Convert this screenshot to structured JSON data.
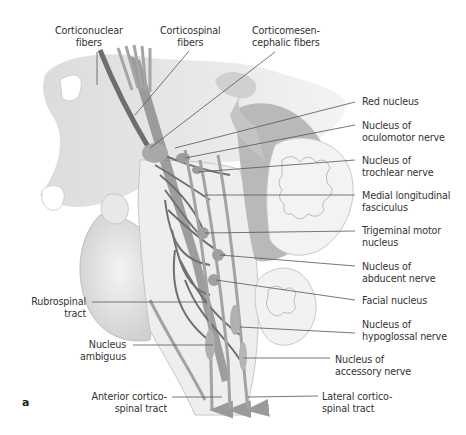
{
  "figure": {
    "panel_letter": "a",
    "colors": {
      "fiber_dark": "#6e6e6e",
      "fiber_mid": "#9a9a9a",
      "tissue_light": "#e2e2e2",
      "tissue_shadow": "#bdbdbd",
      "leader_line": "#555555"
    }
  },
  "labels": {
    "top": [
      {
        "id": "corticonuclear",
        "text": "Corticonuclear\nfibers"
      },
      {
        "id": "corticospinal",
        "text": "Corticospinal\nfibers"
      },
      {
        "id": "corticomesencephalic",
        "text": "Corticomesen-\ncephalic fibers"
      }
    ],
    "right": [
      {
        "id": "red-nucleus",
        "text": "Red nucleus"
      },
      {
        "id": "oculomotor",
        "text": "Nucleus of\noculomotor nerve"
      },
      {
        "id": "trochlear",
        "text": "Nucleus of\ntrochlear nerve"
      },
      {
        "id": "mlf",
        "text": "Medial longitudinal\nfasciculus"
      },
      {
        "id": "trigeminal",
        "text": "Trigeminal motor\nnucleus"
      },
      {
        "id": "abducent",
        "text": "Nucleus of\nabducent nerve"
      },
      {
        "id": "facial",
        "text": "Facial nucleus"
      },
      {
        "id": "hypoglossal",
        "text": "Nucleus of\nhypoglossal nerve"
      },
      {
        "id": "accessory",
        "text": "Nucleus of\naccessory nerve"
      },
      {
        "id": "lateral-cst",
        "text": "Lateral cortico-\nspinal tract"
      }
    ],
    "left": [
      {
        "id": "rubrospinal",
        "text": "Rubrospinal\ntract"
      },
      {
        "id": "ambiguus",
        "text": "Nucleus\nambiguus"
      },
      {
        "id": "anterior-cst",
        "text": "Anterior cortico-\nspinal tract"
      }
    ]
  }
}
